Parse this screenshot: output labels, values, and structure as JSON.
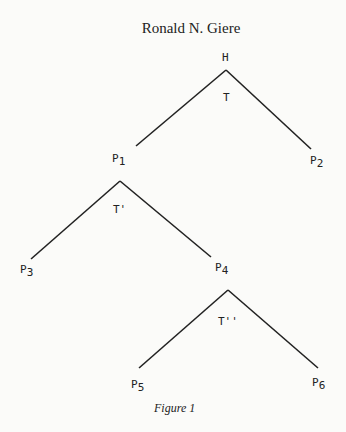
{
  "header": {
    "author": "Ronald N. Giere"
  },
  "diagram": {
    "type": "tree",
    "nodes": {
      "H": {
        "label": "H"
      },
      "P1": {
        "label": "P",
        "sub": "1"
      },
      "P2": {
        "label": "P",
        "sub": "2"
      },
      "P3": {
        "label": "P",
        "sub": "3"
      },
      "P4": {
        "label": "P",
        "sub": "4"
      },
      "P5": {
        "label": "P",
        "sub": "5"
      },
      "P6": {
        "label": "P",
        "sub": "6"
      }
    },
    "theories": {
      "T": "T",
      "T1": "T'",
      "T2": "T''"
    },
    "edges": [
      {
        "from": "H",
        "to": "P1",
        "via": "T"
      },
      {
        "from": "H",
        "to": "P2",
        "via": "T"
      },
      {
        "from": "P1",
        "to": "P3",
        "via": "T'"
      },
      {
        "from": "P1",
        "to": "P4",
        "via": "T'"
      },
      {
        "from": "P4",
        "to": "P5",
        "via": "T''"
      },
      {
        "from": "P4",
        "to": "P6",
        "via": "T''"
      }
    ],
    "line_color": "#222222"
  },
  "caption": "Figure 1"
}
